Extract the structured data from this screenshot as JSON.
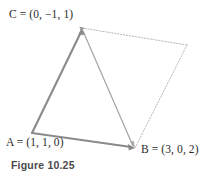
{
  "figure": {
    "caption": "Figure 10.25",
    "background_color": "#ffffff",
    "solid_stroke_color": "#8a8a8a",
    "thin_stroke_color": "#a8a8a8",
    "dotted_stroke_color": "#b5b5b5",
    "label_color": "#2b2b2b",
    "caption_color": "#4a4a4a"
  },
  "points": {
    "a": {
      "name": "A",
      "equals": "=",
      "coords": "(1, 1, 0)",
      "label": "A = (1, 1, 0)",
      "x": 32,
      "y": 133
    },
    "b": {
      "name": "B",
      "equals": "=",
      "coords": "(3, 0, 2)",
      "label": "B = (3, 0, 2)",
      "x": 135,
      "y": 148
    },
    "c": {
      "name": "C",
      "equals": "=",
      "coords": "(0, −1, 1)",
      "label": "C = (0, −1, 1)",
      "x": 82,
      "y": 28
    },
    "d": {
      "name": "",
      "x": 187,
      "y": 45
    }
  },
  "edges": [
    {
      "id": "ac",
      "from": "a",
      "to": "c",
      "style": "solid",
      "arrow": "at-end",
      "width": 2.1
    },
    {
      "id": "ab",
      "from": "a",
      "to": "b",
      "style": "solid",
      "arrow": "at-end",
      "width": 1.8
    },
    {
      "id": "cb",
      "from": "c",
      "to": "b",
      "style": "solid",
      "arrow": "at-end",
      "width": 1.2
    },
    {
      "id": "cd",
      "from": "c",
      "to": "d",
      "style": "dotted",
      "arrow": "none",
      "width": 1.0
    },
    {
      "id": "db",
      "from": "d",
      "to": "b",
      "style": "dotted",
      "arrow": "none",
      "width": 1.0
    }
  ]
}
